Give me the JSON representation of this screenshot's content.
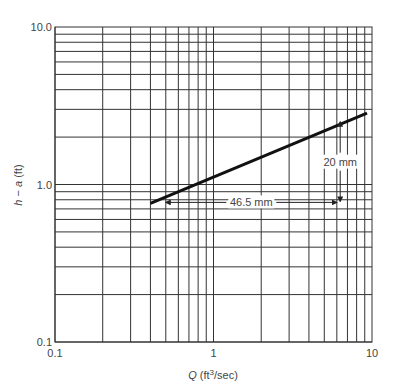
{
  "chart_data": {
    "type": "line",
    "title": "",
    "xlabel": "Q (ft³/sec)",
    "xlabel_parts": {
      "italic": "Q",
      "rest_pre": " (ft",
      "sup": "3",
      "rest_post": "/sec)"
    },
    "ylabel": "h − a (ft)",
    "ylabel_parts": {
      "italic1": "h",
      "mid": " − ",
      "italic2": "a",
      "rest": " (ft)"
    },
    "xscale": "log",
    "yscale": "log",
    "xlim": [
      0.1,
      10
    ],
    "ylim": [
      0.1,
      10
    ],
    "x_tick_labels": [
      "0.1",
      "1",
      "10"
    ],
    "y_tick_labels": [
      "0.1",
      "1.0",
      "10.0"
    ],
    "grid": true,
    "legend": null,
    "series": [
      {
        "name": "rating curve",
        "x": [
          0.4,
          9.3
        ],
        "y": [
          0.76,
          2.84
        ]
      }
    ],
    "annotations": [
      {
        "text": "46.5 mm",
        "type": "horizontal-dimension",
        "x_from": 0.5,
        "x_to": 6.0,
        "y": 0.77
      },
      {
        "text": "20 mm",
        "type": "vertical-dimension",
        "x": 6.3,
        "y_from": 2.5,
        "y_to": 0.78
      }
    ]
  }
}
